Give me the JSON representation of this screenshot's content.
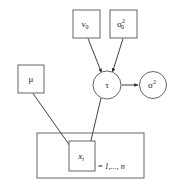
{
  "figure": {
    "kind": "bayesian-network-plate-diagram",
    "background_color": "#ffffff",
    "stroke_color": "#555555",
    "edge_color": "#2b2b2b",
    "text_color": "#1c1c1c"
  },
  "nodes": {
    "nu0": {
      "id": "nu0",
      "shape": "box",
      "label": "ν",
      "subscript": "0",
      "x": 86.5,
      "y": 24,
      "w": 27,
      "h": 28
    },
    "sigma0_sq": {
      "id": "sigma0_sq",
      "shape": "box",
      "label": "σ",
      "subscript": "0",
      "superscript": "2",
      "x": 123.5,
      "y": 24,
      "w": 27,
      "h": 28
    },
    "mu": {
      "id": "mu",
      "shape": "box",
      "label": "μ",
      "x": 31,
      "y": 79,
      "w": 26,
      "h": 28
    },
    "tau": {
      "id": "tau",
      "shape": "circle",
      "label": "τ",
      "cx": 107,
      "cy": 85,
      "r": 14
    },
    "sigma_sq": {
      "id": "sigma_sq",
      "shape": "circle",
      "label": "σ",
      "superscript": "2",
      "cx": 153,
      "cy": 85,
      "r": 13.5
    },
    "x_i": {
      "id": "x_i",
      "shape": "box",
      "label": "x",
      "subscript": "i",
      "italic": true,
      "x": 69,
      "y": 156,
      "w": 26,
      "h": 30
    }
  },
  "plate": {
    "id": "observations-plate",
    "x": 37,
    "y": 133,
    "w": 107,
    "h": 45,
    "index_label": "i = 1,..., n",
    "index_x": 109,
    "index_y": 166
  },
  "edges": [
    {
      "id": "nu0-to-tau",
      "from": "nu0",
      "to": "tau",
      "x1": 88,
      "y1": 38.5,
      "x2": 101.5,
      "y2": 72.5
    },
    {
      "id": "sigma0sq-to-tau",
      "from": "sigma0_sq",
      "to": "tau",
      "x1": 123,
      "y1": 38.5,
      "x2": 112.5,
      "y2": 72
    },
    {
      "id": "tau-to-sigmasq",
      "from": "tau",
      "to": "sigma_sq",
      "x1": 121.5,
      "y1": 85,
      "x2": 138.5,
      "y2": 85
    },
    {
      "id": "mu-to-xi",
      "from": "mu",
      "to": "x_i",
      "x1": 33,
      "y1": 93.5,
      "x2": 75,
      "y2": 153.5
    },
    {
      "id": "tau-to-xi",
      "from": "tau",
      "to": "x_i",
      "x1": 101,
      "y1": 98,
      "x2": 88,
      "y2": 153.5
    }
  ]
}
